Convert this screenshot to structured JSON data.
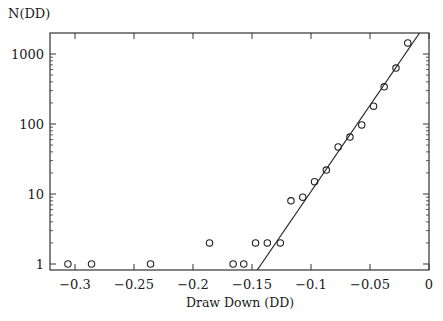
{
  "chart_data": {
    "type": "scatter",
    "title": "",
    "ylabel": "N(DD)",
    "xlabel": "Draw Down (DD)",
    "yscale": "log",
    "xlim": [
      -0.32,
      0.0
    ],
    "ylim": [
      0.8,
      2000
    ],
    "x_ticks": [
      -0.3,
      -0.25,
      -0.2,
      -0.15,
      -0.1,
      -0.05,
      0
    ],
    "x_tick_labels": [
      "−0.3",
      "−0.25",
      "−0.2",
      "−0.15",
      "−0.1",
      "−0.05",
      "0"
    ],
    "y_ticks": [
      1,
      10,
      100,
      1000
    ],
    "y_tick_labels": [
      "1",
      "10",
      "100",
      "1000"
    ],
    "grid": false,
    "legend": null,
    "series": [
      {
        "name": "observed",
        "style": "open-circle",
        "points": [
          {
            "x": -0.306,
            "y": 1
          },
          {
            "x": -0.286,
            "y": 1
          },
          {
            "x": -0.236,
            "y": 1
          },
          {
            "x": -0.186,
            "y": 2
          },
          {
            "x": -0.166,
            "y": 1
          },
          {
            "x": -0.157,
            "y": 1
          },
          {
            "x": -0.147,
            "y": 2
          },
          {
            "x": -0.137,
            "y": 2
          },
          {
            "x": -0.126,
            "y": 2
          },
          {
            "x": -0.117,
            "y": 8
          },
          {
            "x": -0.107,
            "y": 9
          },
          {
            "x": -0.097,
            "y": 15
          },
          {
            "x": -0.087,
            "y": 22
          },
          {
            "x": -0.077,
            "y": 47
          },
          {
            "x": -0.067,
            "y": 65
          },
          {
            "x": -0.057,
            "y": 97
          },
          {
            "x": -0.047,
            "y": 180
          },
          {
            "x": -0.038,
            "y": 340
          },
          {
            "x": -0.028,
            "y": 630
          },
          {
            "x": -0.018,
            "y": 1440
          }
        ]
      },
      {
        "name": "exponential fit",
        "style": "line",
        "points": [
          {
            "x": -0.146,
            "y": 0.8
          },
          {
            "x": -0.008,
            "y": 2000
          }
        ]
      }
    ]
  }
}
